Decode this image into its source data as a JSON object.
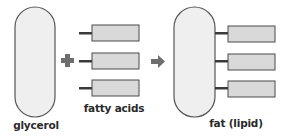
{
  "labels": {
    "glycerol": "glycerol",
    "fatty_acids": "fatty acids",
    "fat": "fat (lipid)"
  },
  "symbols": {
    "plus": "plus-sign",
    "arrow": "right-arrow"
  },
  "colors": {
    "oval_fill": "#efefef",
    "oval_stroke": "#555555",
    "rect_fill": "#d9d9d9",
    "rect_stroke": "#4a4a4a",
    "bond": "#3a3a3a",
    "symbol": "#6e6e6e",
    "text": "#2a2a2a"
  }
}
